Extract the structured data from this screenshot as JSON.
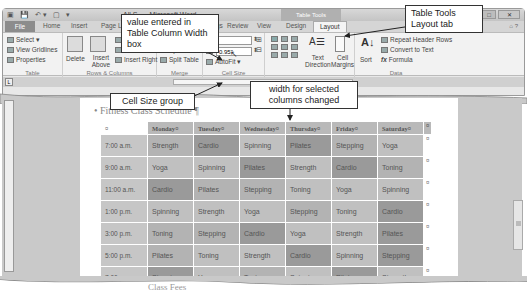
{
  "window": {
    "title": "All S... - Microsoft Word",
    "contextual_tab_group": "Table Tools",
    "controls": {
      "minimize": "–",
      "maximize": "□",
      "close": "✕"
    }
  },
  "ribbon": {
    "tabs": [
      {
        "label": "File"
      },
      {
        "label": "Home"
      },
      {
        "label": "Insert"
      },
      {
        "label": "Page Layout"
      },
      {
        "label": "References"
      },
      {
        "label": "Mailings"
      },
      {
        "label": "Review"
      },
      {
        "label": "View"
      },
      {
        "label": "Design"
      },
      {
        "label": "Layout",
        "active": true
      }
    ],
    "groups": {
      "table": {
        "label": "Table",
        "items": [
          "Select ▾",
          "View Gridlines",
          "Properties"
        ]
      },
      "rows_columns": {
        "label": "Rows & Columns",
        "delete": "Delete",
        "insert_above": "Insert Above",
        "insert_below": "Insert Below",
        "insert_left": "Insert Left",
        "insert_right": "Insert Right"
      },
      "merge": {
        "label": "Merge",
        "items": [
          "Merge Cells",
          "Split Cells",
          "Split Table"
        ]
      },
      "cell_size": {
        "label": "Cell Size",
        "row_height": "",
        "column_width": "0.95\"",
        "autofit": "AutoFit ▾"
      },
      "alignment": {
        "label": "Alignment",
        "text_direction": "Text Direction",
        "cell_margins": "Cell Margins"
      },
      "data": {
        "label": "Data",
        "sort": "Sort",
        "items": [
          "Repeat Header Rows",
          "Convert to Text",
          "Formula"
        ]
      }
    }
  },
  "document": {
    "heading": "Fitness Class Schedule",
    "footer_text": "Class Fees",
    "table": {
      "columns": [
        "",
        "Monday",
        "Tuesday",
        "Wednesday",
        "Thursday",
        "Friday",
        "Saturday"
      ],
      "rows": [
        {
          "time": "7:00 a.m.",
          "cells": [
            "Strength",
            "Cardio",
            "Spinning",
            "Pilates",
            "Stepping",
            "Yoga"
          ]
        },
        {
          "time": "9:00 a.m.",
          "cells": [
            "Yoga",
            "Spinning",
            "Pilates",
            "Strength",
            "Cardio",
            "Toning"
          ]
        },
        {
          "time": "11:00 a.m.",
          "cells": [
            "Cardio",
            "Pilates",
            "Stepping",
            "Toning",
            "Yoga",
            "Spinning"
          ]
        },
        {
          "time": "1:00 p.m.",
          "cells": [
            "Spinning",
            "Strength",
            "Yoga",
            "Stepping",
            "Toning",
            "Cardio"
          ]
        },
        {
          "time": "3:00 p.m.",
          "cells": [
            "Toning",
            "Stepping",
            "Cardio",
            "Yoga",
            "Strength",
            "Pilates"
          ]
        },
        {
          "time": "5:00 p.m.",
          "cells": [
            "Pilates",
            "Toning",
            "Strength",
            "Cardio",
            "Spinning",
            "Stepping"
          ]
        },
        {
          "time": "7:00 p.m.",
          "cells": [
            "Stepping",
            "Yoga",
            "Toning",
            "Spinning",
            "Pilates",
            "Strength"
          ]
        }
      ],
      "cell_end_mark": "¤"
    }
  },
  "callouts": {
    "value_entered": "value entered in Table Column Width box",
    "table_tools_layout": "Table Tools Layout tab",
    "cell_size_group": "Cell Size group",
    "width_changed": "width for selected columns changed"
  }
}
